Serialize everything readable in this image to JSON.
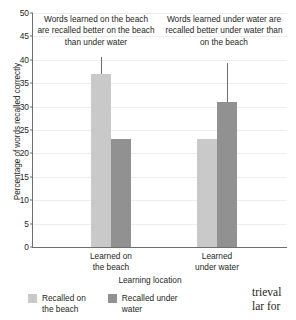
{
  "chart_data": {
    "type": "bar",
    "title": "",
    "xlabel": "Learning location",
    "ylabel": "Percentage of words recalled correctly",
    "categories": [
      "Learned on\nthe beach",
      "Learned\nunder water"
    ],
    "series": [
      {
        "name": "Recalled on\nthe beach",
        "color": "#c9c9c9",
        "values": [
          37,
          23
        ]
      },
      {
        "name": "Recalled under\nwater",
        "color": "#919191",
        "values": [
          23,
          31
        ]
      }
    ],
    "ylim": [
      0,
      50
    ],
    "yticks": [
      0,
      5,
      10,
      15,
      20,
      25,
      30,
      35,
      40,
      45,
      50
    ],
    "grid": true,
    "legend_position": "below-left",
    "annotations": [
      {
        "id": "annotation-left",
        "text": "Words learned on the beach are recalled better on the beach than under water",
        "points_to": "group-0 light bar"
      },
      {
        "id": "annotation-right",
        "text": "Words learned under water are recalled better under water than on the beach",
        "points_to": "group-1 dark bar"
      }
    ]
  },
  "page_bleed": {
    "text": "trieval\nlar for"
  }
}
